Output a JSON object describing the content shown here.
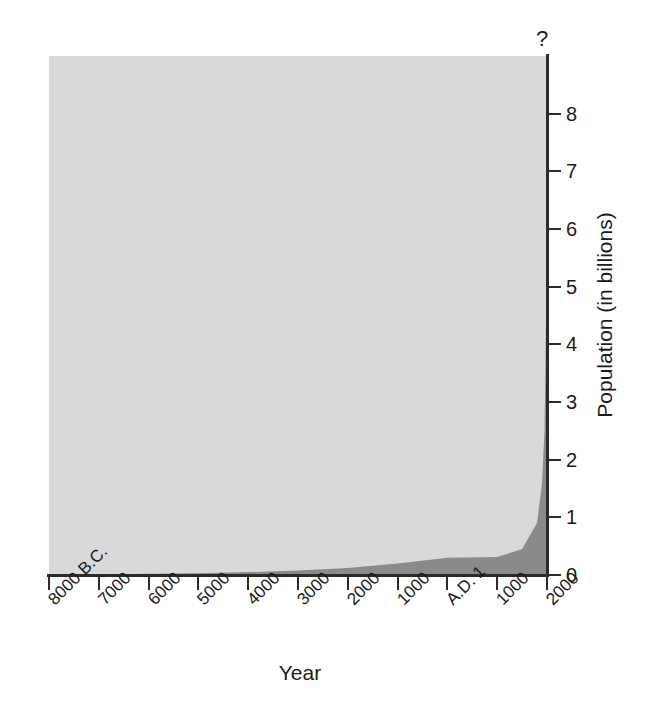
{
  "chart_data": {
    "type": "area",
    "title": "",
    "subtitle": "",
    "xlabel": "Year",
    "ylabel": "Population (in billions)",
    "x_tick_labels": [
      "8000 B.C.",
      "7000",
      "6000",
      "5000",
      "4000",
      "3000",
      "2000",
      "1000",
      "A.D. 1",
      "1000",
      "2000"
    ],
    "x_tick_values": [
      -8000,
      -7000,
      -6000,
      -5000,
      -4000,
      -3000,
      -2000,
      -1000,
      1,
      1000,
      2000
    ],
    "y_tick_labels": [
      "0",
      "1",
      "2",
      "3",
      "4",
      "5",
      "6",
      "7",
      "8"
    ],
    "y_tick_values": [
      0,
      1,
      2,
      3,
      4,
      5,
      6,
      7,
      8
    ],
    "ylim": [
      0,
      9.0
    ],
    "xlim": [
      -8000,
      2000
    ],
    "grid": false,
    "legend": null,
    "annotations": [
      {
        "text": "?",
        "position": "above-top-of-y-axis",
        "x": 2000,
        "y": 9.0
      }
    ],
    "series": [
      {
        "name": "World population",
        "x": [
          -8000,
          -7000,
          -6000,
          -5000,
          -4000,
          -3000,
          -2000,
          -1000,
          1,
          1000,
          1500,
          1800,
          1900,
          1950,
          1975,
          2000
        ],
        "values": [
          0.005,
          0.01,
          0.02,
          0.03,
          0.05,
          0.08,
          0.12,
          0.2,
          0.3,
          0.31,
          0.45,
          0.9,
          1.6,
          2.5,
          4.0,
          6.1
        ]
      }
    ],
    "colors": {
      "area_fill": "#8a8a8a",
      "panel_background": "#d9d9d9",
      "axis": "#2b2b2b",
      "text": "#1a1a1a"
    }
  }
}
